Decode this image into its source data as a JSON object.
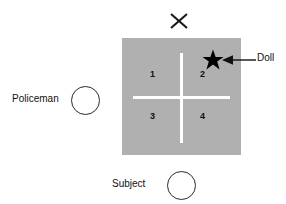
{
  "diagram": {
    "board": {
      "name": "gray-board",
      "color": "#b0b0b0",
      "cross_color": "#ffffff",
      "quadrants": [
        {
          "id": "1",
          "label": "1",
          "position": "top-left"
        },
        {
          "id": "2",
          "label": "2",
          "position": "top-right"
        },
        {
          "id": "3",
          "label": "3",
          "position": "bottom-left"
        },
        {
          "id": "4",
          "label": "4",
          "position": "bottom-right"
        }
      ]
    },
    "markers": {
      "doll": {
        "label": "Doll",
        "icon": "star-icon",
        "color": "#000000",
        "quadrant": "2"
      },
      "x_marker": {
        "label": "X",
        "icon": "x-marker-icon",
        "color": "#1a1a1a",
        "position": "above-board-center"
      },
      "arrow": {
        "icon": "arrow-left-icon",
        "color": "#111111",
        "points_to": "Doll"
      }
    },
    "people": [
      {
        "name": "policeman",
        "label": "Policeman",
        "icon": "circle-icon",
        "position": "left-of-board"
      },
      {
        "name": "subject",
        "label": "Subject",
        "icon": "circle-icon",
        "position": "below-board"
      }
    ]
  }
}
